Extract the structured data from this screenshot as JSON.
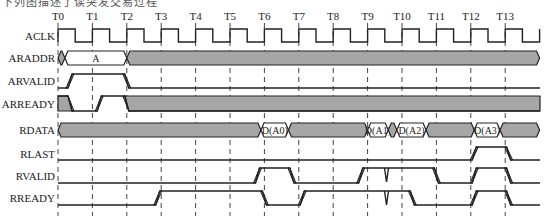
{
  "caption": "下列图描述了读突发交易过程",
  "time_labels": [
    "T0",
    "T1",
    "T2",
    "T3",
    "T4",
    "T5",
    "T6",
    "T7",
    "T8",
    "T9",
    "T10",
    "T11",
    "T12",
    "T13"
  ],
  "signals": [
    {
      "name": "ACLK",
      "type": "clock"
    },
    {
      "name": "ARADDR",
      "type": "bus",
      "segments": [
        {
          "from": 0,
          "to": 0.2,
          "value": null
        },
        {
          "from": 0.2,
          "to": 2.0,
          "value": "A"
        },
        {
          "from": 2.0,
          "to": 14.0,
          "value": null
        }
      ]
    },
    {
      "name": "ARVALID",
      "type": "logic",
      "transitions": [
        [
          0,
          0
        ],
        [
          0.35,
          1
        ],
        [
          2.0,
          0
        ]
      ]
    },
    {
      "name": "ARREADY",
      "type": "logic",
      "transitions": [
        [
          0,
          1
        ],
        [
          0.35,
          0
        ],
        [
          1.2,
          1
        ],
        [
          2.0,
          0
        ]
      ],
      "shaded_high": true
    },
    {
      "name": "RDATA",
      "type": "bus",
      "segments": [
        {
          "from": 0,
          "to": 5.9,
          "value": null
        },
        {
          "from": 5.9,
          "to": 6.7,
          "value": "D(A0)"
        },
        {
          "from": 6.7,
          "to": 9.0,
          "value": null
        },
        {
          "from": 9.0,
          "to": 9.6,
          "value": "D(A1)"
        },
        {
          "from": 9.6,
          "to": 9.85,
          "value": null
        },
        {
          "from": 9.85,
          "to": 10.7,
          "value": "D(A2)"
        },
        {
          "from": 10.7,
          "to": 12.1,
          "value": null
        },
        {
          "from": 12.1,
          "to": 12.85,
          "value": "D(A3)"
        },
        {
          "from": 12.85,
          "to": 14.0,
          "value": null
        }
      ]
    },
    {
      "name": "RLAST",
      "type": "logic",
      "transitions": [
        [
          0,
          0
        ],
        [
          12.1,
          1
        ],
        [
          13.1,
          0
        ]
      ]
    },
    {
      "name": "RVALID",
      "type": "logic",
      "transitions": [
        [
          0,
          0
        ],
        [
          5.8,
          1
        ],
        [
          6.8,
          0
        ],
        [
          8.8,
          1
        ],
        [
          10.0,
          1
        ],
        [
          11.0,
          0
        ],
        [
          12.1,
          1
        ],
        [
          13.1,
          0
        ]
      ],
      "glitches": [
        9.55
      ]
    },
    {
      "name": "RREADY",
      "type": "logic",
      "transitions": [
        [
          0,
          0
        ],
        [
          2.9,
          1
        ],
        [
          6.0,
          0
        ],
        [
          7.1,
          1
        ],
        [
          10.3,
          0
        ],
        [
          12.1,
          1
        ],
        [
          13.1,
          0
        ]
      ],
      "glitches": [
        9.55
      ]
    }
  ],
  "colors": {
    "bus_fill": "#a6a6a6",
    "line": "#222222",
    "background": "#ffffff"
  }
}
